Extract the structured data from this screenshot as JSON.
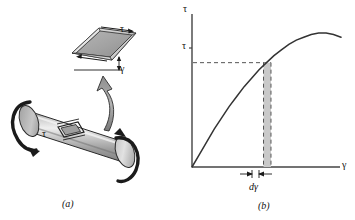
{
  "figure": {
    "background_color": "#ffffff",
    "panels": [
      {
        "id": "a",
        "caption": "(a)",
        "description": "Circular shaft in torsion with shear element"
      },
      {
        "id": "b",
        "caption": "(b)",
        "description": "Shear stress versus shear strain diagram"
      }
    ]
  },
  "panel_a": {
    "caption": "(a)",
    "element_shear_stress_label": "τ",
    "element_shear_strain_label": "γ",
    "shaft_shear_stress_label": "τ",
    "shaft_fill_color": "#b0b0b0",
    "element_fill_color": "#a8a8a8",
    "outline_color": "#1a1a1a",
    "parts": [
      "cylindrical-shaft",
      "left-torque-arrow",
      "right-torque-arrow",
      "callout-arrow",
      "shear-element-on-shaft",
      "enlarged-shear-element"
    ]
  },
  "panel_b": {
    "caption": "(b)",
    "y_axis_label": "τ",
    "x_axis_label": "γ",
    "tau_tick_label": "τ",
    "strip_label": "dγ",
    "curve_color": "#333333",
    "dashed_color": "#555555",
    "strip_fill_color": "#c9c9c9",
    "axis_color": "#444444"
  },
  "chart_data": {
    "type": "line",
    "title": "",
    "xlabel": "γ",
    "ylabel": "τ",
    "xlim": [
      0,
      1
    ],
    "ylim": [
      0,
      1
    ],
    "grid": false,
    "legend": null,
    "series": [
      {
        "name": "shear stress-strain curve",
        "x": [
          0.0,
          0.05,
          0.1,
          0.15,
          0.2,
          0.25,
          0.3,
          0.35,
          0.4,
          0.45,
          0.5,
          0.55,
          0.6,
          0.65,
          0.7,
          0.75,
          0.8,
          0.85,
          0.9,
          0.95,
          1.0
        ],
        "y": [
          0.0,
          0.09,
          0.18,
          0.27,
          0.35,
          0.43,
          0.5,
          0.57,
          0.63,
          0.69,
          0.74,
          0.79,
          0.83,
          0.87,
          0.9,
          0.92,
          0.94,
          0.95,
          0.95,
          0.94,
          0.92
        ]
      }
    ],
    "annotations": [
      {
        "name": "tau-level-dashed-line",
        "type": "hline",
        "y": 0.74,
        "style": "dashed",
        "label": "τ"
      },
      {
        "name": "gamma-dashed-line-left",
        "type": "vline",
        "x": 0.48,
        "style": "dashed"
      },
      {
        "name": "gamma-dashed-line-right",
        "type": "vline",
        "x": 0.53,
        "style": "dashed"
      },
      {
        "name": "d-gamma-strip",
        "type": "vspan",
        "x0": 0.48,
        "x1": 0.53,
        "label": "dγ",
        "fill": "#c9c9c9"
      }
    ]
  }
}
